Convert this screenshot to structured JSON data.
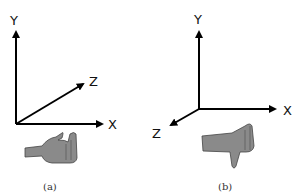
{
  "figures": [
    {
      "id": "a",
      "caption": "(a)",
      "axes": {
        "x": "X",
        "y": "Y",
        "z": "Z"
      },
      "z_direction": "into screen (up-right)",
      "hand": "left hand, fingers curled"
    },
    {
      "id": "b",
      "caption": "(b)",
      "axes": {
        "x": "X",
        "y": "Y",
        "z": "Z"
      },
      "z_direction": "out of screen (down-left)",
      "hand": "right hand, thumb pointing down"
    }
  ],
  "colors": {
    "axis": "#000000",
    "hand_fill": "#8a8a8a",
    "hand_stroke": "#444444",
    "background": "#ffffff"
  }
}
